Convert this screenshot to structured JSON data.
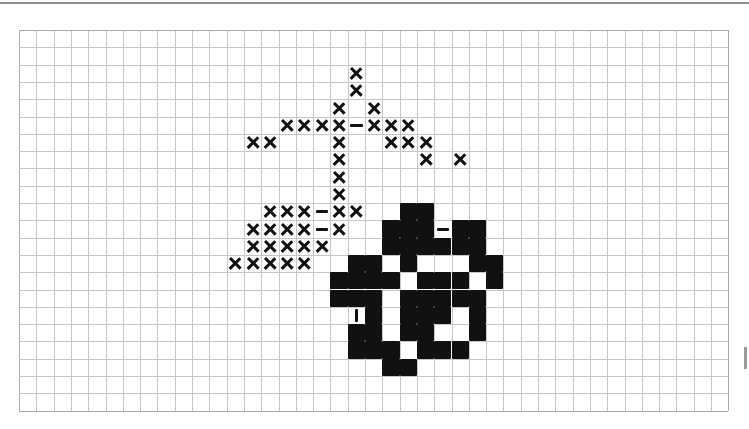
{
  "document": {
    "type": "cross-stitch-pattern-chart",
    "title": "",
    "background_color": "#ffffff",
    "top_rule_color": "#8f8f8f"
  },
  "chart_data": {
    "type": "heatmap",
    "title": "",
    "subtitle": "",
    "xlabel": "",
    "ylabel": "",
    "grid": true,
    "legend_position": "none",
    "grid_color": "#c4c6c8",
    "symbol_color": "#111111",
    "columns": 41,
    "rows": 22,
    "cell_size_px": 17.3,
    "origin_px": {
      "x": 19,
      "y": 30
    },
    "legend_entries": [
      {
        "symbol": "cross",
        "label": "X"
      },
      {
        "symbol": "block",
        "label": "filled square"
      },
      {
        "symbol": "dash",
        "label": "horizontal backstitch"
      },
      {
        "symbol": "bar",
        "label": "vertical backstitch"
      }
    ],
    "categories": [],
    "values": [],
    "stitches": [
      {
        "c": 19,
        "r": 2,
        "s": "cross"
      },
      {
        "c": 19,
        "r": 3,
        "s": "cross"
      },
      {
        "c": 18,
        "r": 4,
        "s": "cross"
      },
      {
        "c": 20,
        "r": 4,
        "s": "cross"
      },
      {
        "c": 15,
        "r": 5,
        "s": "cross"
      },
      {
        "c": 16,
        "r": 5,
        "s": "cross"
      },
      {
        "c": 17,
        "r": 5,
        "s": "cross"
      },
      {
        "c": 18,
        "r": 5,
        "s": "cross"
      },
      {
        "c": 19,
        "r": 5,
        "s": "dash"
      },
      {
        "c": 20,
        "r": 5,
        "s": "cross"
      },
      {
        "c": 21,
        "r": 5,
        "s": "cross"
      },
      {
        "c": 22,
        "r": 5,
        "s": "cross"
      },
      {
        "c": 13,
        "r": 6,
        "s": "cross"
      },
      {
        "c": 14,
        "r": 6,
        "s": "cross"
      },
      {
        "c": 18,
        "r": 6,
        "s": "cross"
      },
      {
        "c": 21,
        "r": 6,
        "s": "cross"
      },
      {
        "c": 22,
        "r": 6,
        "s": "cross"
      },
      {
        "c": 23,
        "r": 6,
        "s": "cross"
      },
      {
        "c": 18,
        "r": 7,
        "s": "cross"
      },
      {
        "c": 23,
        "r": 7,
        "s": "cross"
      },
      {
        "c": 25,
        "r": 7,
        "s": "cross"
      },
      {
        "c": 18,
        "r": 8,
        "s": "cross"
      },
      {
        "c": 18,
        "r": 9,
        "s": "cross"
      },
      {
        "c": 14,
        "r": 10,
        "s": "cross"
      },
      {
        "c": 15,
        "r": 10,
        "s": "cross"
      },
      {
        "c": 16,
        "r": 10,
        "s": "cross"
      },
      {
        "c": 17,
        "r": 10,
        "s": "dash"
      },
      {
        "c": 18,
        "r": 10,
        "s": "cross"
      },
      {
        "c": 19,
        "r": 10,
        "s": "cross"
      },
      {
        "c": 22,
        "r": 10,
        "s": "block"
      },
      {
        "c": 23,
        "r": 10,
        "s": "block"
      },
      {
        "c": 13,
        "r": 11,
        "s": "cross"
      },
      {
        "c": 14,
        "r": 11,
        "s": "cross"
      },
      {
        "c": 15,
        "r": 11,
        "s": "cross"
      },
      {
        "c": 16,
        "r": 11,
        "s": "cross"
      },
      {
        "c": 17,
        "r": 11,
        "s": "dash"
      },
      {
        "c": 18,
        "r": 11,
        "s": "cross"
      },
      {
        "c": 21,
        "r": 11,
        "s": "block"
      },
      {
        "c": 22,
        "r": 11,
        "s": "block"
      },
      {
        "c": 23,
        "r": 11,
        "s": "block"
      },
      {
        "c": 24,
        "r": 11,
        "s": "dash"
      },
      {
        "c": 25,
        "r": 11,
        "s": "block"
      },
      {
        "c": 26,
        "r": 11,
        "s": "block"
      },
      {
        "c": 13,
        "r": 12,
        "s": "cross"
      },
      {
        "c": 14,
        "r": 12,
        "s": "cross"
      },
      {
        "c": 15,
        "r": 12,
        "s": "cross"
      },
      {
        "c": 16,
        "r": 12,
        "s": "cross"
      },
      {
        "c": 17,
        "r": 12,
        "s": "cross"
      },
      {
        "c": 21,
        "r": 12,
        "s": "block"
      },
      {
        "c": 22,
        "r": 12,
        "s": "block"
      },
      {
        "c": 23,
        "r": 12,
        "s": "block"
      },
      {
        "c": 24,
        "r": 12,
        "s": "block"
      },
      {
        "c": 25,
        "r": 12,
        "s": "block"
      },
      {
        "c": 26,
        "r": 12,
        "s": "block"
      },
      {
        "c": 12,
        "r": 13,
        "s": "cross"
      },
      {
        "c": 13,
        "r": 13,
        "s": "cross"
      },
      {
        "c": 14,
        "r": 13,
        "s": "cross"
      },
      {
        "c": 15,
        "r": 13,
        "s": "cross"
      },
      {
        "c": 16,
        "r": 13,
        "s": "cross"
      },
      {
        "c": 19,
        "r": 13,
        "s": "block"
      },
      {
        "c": 20,
        "r": 13,
        "s": "block"
      },
      {
        "c": 22,
        "r": 13,
        "s": "block"
      },
      {
        "c": 26,
        "r": 13,
        "s": "block"
      },
      {
        "c": 27,
        "r": 13,
        "s": "block"
      },
      {
        "c": 18,
        "r": 14,
        "s": "block"
      },
      {
        "c": 19,
        "r": 14,
        "s": "block"
      },
      {
        "c": 20,
        "r": 14,
        "s": "block"
      },
      {
        "c": 21,
        "r": 14,
        "s": "block"
      },
      {
        "c": 23,
        "r": 14,
        "s": "block"
      },
      {
        "c": 24,
        "r": 14,
        "s": "block"
      },
      {
        "c": 25,
        "r": 14,
        "s": "block"
      },
      {
        "c": 27,
        "r": 14,
        "s": "block"
      },
      {
        "c": 18,
        "r": 15,
        "s": "block"
      },
      {
        "c": 19,
        "r": 15,
        "s": "block"
      },
      {
        "c": 20,
        "r": 15,
        "s": "block"
      },
      {
        "c": 22,
        "r": 15,
        "s": "block"
      },
      {
        "c": 23,
        "r": 15,
        "s": "block"
      },
      {
        "c": 24,
        "r": 15,
        "s": "block"
      },
      {
        "c": 25,
        "r": 15,
        "s": "block"
      },
      {
        "c": 26,
        "r": 15,
        "s": "block"
      },
      {
        "c": 19,
        "r": 16,
        "s": "bar"
      },
      {
        "c": 20,
        "r": 16,
        "s": "block"
      },
      {
        "c": 22,
        "r": 16,
        "s": "block"
      },
      {
        "c": 23,
        "r": 16,
        "s": "block"
      },
      {
        "c": 24,
        "r": 16,
        "s": "block"
      },
      {
        "c": 26,
        "r": 16,
        "s": "block"
      },
      {
        "c": 19,
        "r": 17,
        "s": "block"
      },
      {
        "c": 20,
        "r": 17,
        "s": "block"
      },
      {
        "c": 22,
        "r": 17,
        "s": "block"
      },
      {
        "c": 23,
        "r": 17,
        "s": "block"
      },
      {
        "c": 26,
        "r": 17,
        "s": "block"
      },
      {
        "c": 19,
        "r": 18,
        "s": "block"
      },
      {
        "c": 20,
        "r": 18,
        "s": "block"
      },
      {
        "c": 21,
        "r": 18,
        "s": "block"
      },
      {
        "c": 23,
        "r": 18,
        "s": "block"
      },
      {
        "c": 24,
        "r": 18,
        "s": "block"
      },
      {
        "c": 25,
        "r": 18,
        "s": "block"
      },
      {
        "c": 21,
        "r": 19,
        "s": "block"
      },
      {
        "c": 22,
        "r": 19,
        "s": "block"
      }
    ]
  }
}
